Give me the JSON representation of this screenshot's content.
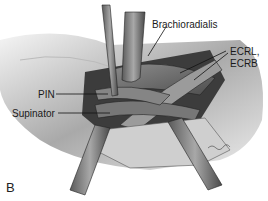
{
  "figure": {
    "panel_label": "B",
    "labels": {
      "brachioradialis": "Brachioradialis",
      "ecrl": "ECRL,",
      "ecrb": "ECRB",
      "pin": "PIN",
      "supinator": "Supinator"
    }
  }
}
